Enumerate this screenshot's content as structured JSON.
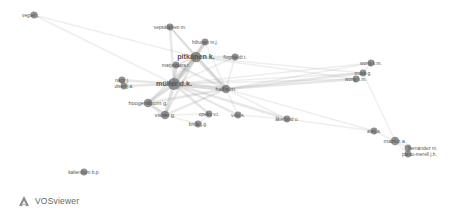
{
  "app": {
    "name": "VOSviewer"
  },
  "network": {
    "type": "co-authorship",
    "nodes": [
      {
        "id": "vegter",
        "label": "vegter j.",
        "size": 2,
        "weight": "light"
      },
      {
        "id": "veposalainen",
        "label": "vepsäläinen m.",
        "size": 2,
        "weight": "light"
      },
      {
        "id": "hiltunen",
        "label": "hiltunen m.j.",
        "size": 2,
        "weight": "light"
      },
      {
        "id": "pitkanen",
        "label": "pitkänen k.",
        "size": 4,
        "weight": "bold"
      },
      {
        "id": "flognfeldt",
        "label": "flognfeldt t.",
        "size": 2,
        "weight": "light"
      },
      {
        "id": "marjavaara",
        "label": "marjavaara r.",
        "size": 2,
        "weight": "light"
      },
      {
        "id": "muller",
        "label": "müller d.k.",
        "size": 5,
        "weight": "bold"
      },
      {
        "id": "hall",
        "label": "hall c.m.",
        "size": 3,
        "weight": "normal"
      },
      {
        "id": "norris",
        "label": "nagy j.",
        "size": 2,
        "weight": "light"
      },
      {
        "id": "olsen",
        "label": "olsen j.a.",
        "size": 2,
        "weight": "light"
      },
      {
        "id": "hoogendoorn",
        "label": "hoogendoorn g.",
        "size": 3,
        "weight": "normal"
      },
      {
        "id": "visser",
        "label": "visser g.",
        "size": 3,
        "weight": "normal"
      },
      {
        "id": "opeku",
        "label": "opeku v.t.",
        "size": 2,
        "weight": "light"
      },
      {
        "id": "bridge",
        "label": "brida j.g.",
        "size": 2,
        "weight": "light"
      },
      {
        "id": "velo",
        "label": "velo s.",
        "size": 2,
        "weight": "light"
      },
      {
        "id": "akerlund",
        "label": "åkerlund u.",
        "size": 2,
        "weight": "light"
      },
      {
        "id": "wong_km",
        "label": "wong k.m.",
        "size": 2,
        "weight": "light"
      },
      {
        "id": "musa",
        "label": "musa g.",
        "size": 2,
        "weight": "light"
      },
      {
        "id": "wong_m",
        "label": "wong k.m.",
        "size": 2,
        "weight": "light"
      },
      {
        "id": "ateljevic",
        "label": "atelj a.",
        "size": 2,
        "weight": "light"
      },
      {
        "id": "mazon",
        "label": "mazón a.",
        "size": 3,
        "weight": "normal"
      },
      {
        "id": "hernandez",
        "label": "hernández m.",
        "size": 2,
        "weight": "light"
      },
      {
        "id": "ferrer",
        "label": "parau-merell j.h.",
        "size": 2,
        "weight": "light"
      },
      {
        "id": "kaltenborn",
        "label": "kaltenborn b.p.",
        "size": 2,
        "weight": "light"
      }
    ],
    "edges": [
      [
        "vegter",
        "muller",
        1
      ],
      [
        "vegter",
        "pitkanen",
        1
      ],
      [
        "veposalainen",
        "pitkanen",
        2
      ],
      [
        "veposalainen",
        "muller",
        2
      ],
      [
        "veposalainen",
        "hall",
        1
      ],
      [
        "hiltunen",
        "pitkanen",
        3
      ],
      [
        "hiltunen",
        "muller",
        2
      ],
      [
        "hiltunen",
        "hall",
        1
      ],
      [
        "pitkanen",
        "muller",
        4
      ],
      [
        "pitkanen",
        "hall",
        3
      ],
      [
        "pitkanen",
        "flognfeldt",
        2
      ],
      [
        "pitkanen",
        "marjavaara",
        2
      ],
      [
        "pitkanen",
        "visser",
        2
      ],
      [
        "pitkanen",
        "hoogendoorn",
        2
      ],
      [
        "pitkanen",
        "musa",
        1
      ],
      [
        "pitkanen",
        "wong_m",
        1
      ],
      [
        "flognfeldt",
        "muller",
        1
      ],
      [
        "flognfeldt",
        "hall",
        1
      ],
      [
        "marjavaara",
        "muller",
        3
      ],
      [
        "marjavaara",
        "hall",
        2
      ],
      [
        "muller",
        "hall",
        4
      ],
      [
        "muller",
        "norris",
        2
      ],
      [
        "muller",
        "olsen",
        2
      ],
      [
        "muller",
        "hoogendoorn",
        3
      ],
      [
        "muller",
        "visser",
        3
      ],
      [
        "muller",
        "opeku",
        2
      ],
      [
        "muller",
        "velo",
        2
      ],
      [
        "muller",
        "akerlund",
        2
      ],
      [
        "muller",
        "wong_m",
        1
      ],
      [
        "muller",
        "musa",
        1
      ],
      [
        "muller",
        "wong_km",
        1
      ],
      [
        "hall",
        "visser",
        2
      ],
      [
        "hall",
        "hoogendoorn",
        2
      ],
      [
        "hall",
        "velo",
        1
      ],
      [
        "hall",
        "akerlund",
        1
      ],
      [
        "hall",
        "wong_m",
        2
      ],
      [
        "hall",
        "musa",
        2
      ],
      [
        "hall",
        "wong_km",
        1
      ],
      [
        "hall",
        "ateljevic",
        1
      ],
      [
        "hoogendoorn",
        "visser",
        3
      ],
      [
        "visser",
        "opeku",
        1
      ],
      [
        "visser",
        "bridge",
        1
      ],
      [
        "opeku",
        "bridge",
        1
      ],
      [
        "velo",
        "akerlund",
        1
      ],
      [
        "akerlund",
        "ateljevic",
        1
      ],
      [
        "ateljevic",
        "mazon",
        1
      ],
      [
        "musa",
        "mazon",
        1
      ],
      [
        "wong_m",
        "musa",
        1
      ],
      [
        "wong_km",
        "musa",
        1
      ],
      [
        "mazon",
        "hernandez",
        1
      ],
      [
        "mazon",
        "ferrer",
        1
      ],
      [
        "hernandez",
        "ferrer",
        1
      ]
    ]
  }
}
